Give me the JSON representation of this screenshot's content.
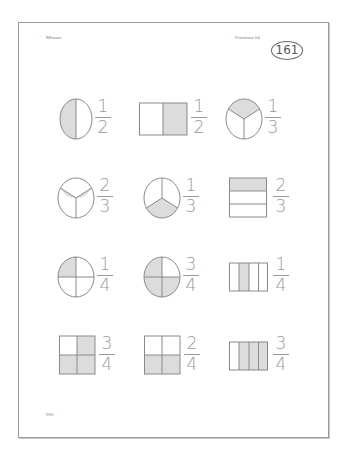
{
  "header": {
    "left_label": "Mixture",
    "right_label": "Fractions #4",
    "page_number": "161"
  },
  "footer": {
    "text": "900"
  },
  "colors": {
    "shade": "#dcdcdc",
    "stroke": "#8a8a8a",
    "numeral": "#9a9a9a"
  },
  "rows": [
    {
      "items": [
        {
          "shape": "circle-halves",
          "shaded": "left half",
          "numerator": "1",
          "denominator": "2"
        },
        {
          "shape": "rect-halves-vertical",
          "shaded": "right half",
          "numerator": "1",
          "denominator": "2"
        },
        {
          "shape": "circle-thirds",
          "shaded": "top third",
          "numerator": "1",
          "denominator": "3"
        }
      ]
    },
    {
      "items": [
        {
          "shape": "circle-thirds",
          "shaded": "left and right lower thirds",
          "numerator": "2",
          "denominator": "3"
        },
        {
          "shape": "circle-thirds",
          "shaded": "bottom third",
          "numerator": "1",
          "denominator": "3"
        },
        {
          "shape": "rect-thirds-horizontal",
          "shaded": "top stripe",
          "numerator": "2",
          "denominator": "3"
        }
      ]
    },
    {
      "items": [
        {
          "shape": "circle-quarters",
          "shaded": "top-left quarter",
          "numerator": "1",
          "denominator": "4"
        },
        {
          "shape": "circle-quarters",
          "shaded": "top-left, bottom-left, bottom-right",
          "numerator": "3",
          "denominator": "4"
        },
        {
          "shape": "rect-quarters-vertical",
          "shaded": "second stripe",
          "numerator": "1",
          "denominator": "4"
        }
      ]
    },
    {
      "items": [
        {
          "shape": "square-quarters",
          "shaded": "top-right, bottom-left, bottom-right",
          "numerator": "3",
          "denominator": "4"
        },
        {
          "shape": "square-quarters",
          "shaded": "bottom-left, bottom-right",
          "numerator": "2",
          "denominator": "4"
        },
        {
          "shape": "rect-quarters-vertical",
          "shaded": "stripes 2-4",
          "numerator": "3",
          "denominator": "4"
        }
      ]
    }
  ]
}
